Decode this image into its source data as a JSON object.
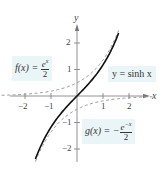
{
  "chart_data": {
    "type": "line",
    "title": "",
    "xlabel": "x",
    "ylabel": "y",
    "xlim": [
      -2.9,
      2.7
    ],
    "ylim": [
      -2.5,
      2.8
    ],
    "x_ticks": [
      "-2",
      "-1",
      "1",
      "2"
    ],
    "y_ticks": [
      "2",
      "1",
      "-1",
      "-2"
    ],
    "grid": false,
    "series": [
      {
        "name": "y = sinh x",
        "style": "solid",
        "color": "#111111",
        "function": "sinh(x)",
        "x": [
          -1.6,
          -1.2,
          -0.8,
          -0.4,
          0,
          0.4,
          0.8,
          1.2,
          1.6
        ],
        "y": [
          -2.38,
          -1.51,
          -0.89,
          -0.41,
          0,
          0.41,
          0.89,
          1.51,
          2.38
        ]
      },
      {
        "name": "f(x) = e^x / 2",
        "style": "dashed",
        "color": "#999999",
        "function": "exp(x)/2",
        "x": [
          -2.9,
          -2,
          -1,
          0,
          1,
          1.6
        ],
        "y": [
          0.03,
          0.07,
          0.18,
          0.5,
          1.36,
          2.48
        ]
      },
      {
        "name": "g(x) = -e^(-x) / 2",
        "style": "dashed",
        "color": "#999999",
        "function": "-exp(-x)/2",
        "x": [
          -1.6,
          -1,
          0,
          1,
          2,
          2.9
        ],
        "y": [
          -2.48,
          -1.36,
          -0.5,
          -0.18,
          -0.07,
          -0.03
        ]
      }
    ],
    "annotations": [
      "f(x) = e^x/2",
      "y = sinh x",
      "g(x) = -e^-x/2"
    ]
  },
  "labels": {
    "f_lhs": "f(x) = ",
    "f_num": "e",
    "f_exp": "x",
    "f_den": "2",
    "sinh": "y = sinh x",
    "g_lhs": "g(x) = −",
    "g_num": "e",
    "g_exp": "−x",
    "g_den": "2"
  },
  "axes": {
    "x_label": "x",
    "y_label": "y",
    "x_ticks": [
      {
        "v": -2,
        "t": "−2"
      },
      {
        "v": -1,
        "t": "−1"
      },
      {
        "v": 1,
        "t": "1"
      },
      {
        "v": 2,
        "t": "2"
      }
    ],
    "y_ticks": [
      {
        "v": 2,
        "t": "2"
      },
      {
        "v": 1,
        "t": "1"
      },
      {
        "v": -1,
        "t": "−1"
      },
      {
        "v": -2,
        "t": "−2"
      }
    ]
  }
}
